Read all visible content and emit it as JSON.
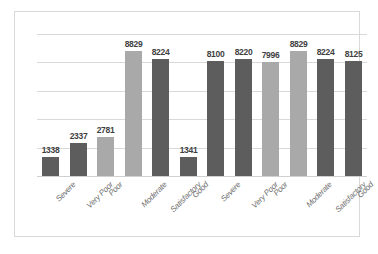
{
  "chart_data": {
    "type": "bar",
    "title": "",
    "subtitle": "",
    "xlabel": "",
    "ylabel": "",
    "ylim": [
      0,
      10000
    ],
    "grid": true,
    "legend": false,
    "legend_position": "none",
    "y_tick_labels": [],
    "categories": [
      "Severe",
      "Very Poor",
      "Poor",
      "Moderate",
      "Satisfactory",
      "Good",
      "Severe",
      "Very Poor",
      "Poor",
      "Moderate",
      "Satisfactory",
      "Good"
    ],
    "values": [
      1338,
      2337,
      2781,
      8829,
      8224,
      1341,
      8100,
      8220,
      7996,
      8829,
      8224,
      8125
    ],
    "data_labels": [
      "1338",
      "2337",
      "2781",
      "8829",
      "8224",
      "1341",
      "8100",
      "8220",
      "7996",
      "8829",
      "8224",
      "8125"
    ],
    "bar_colors": [
      "#5d5d5d",
      "#5d5d5d",
      "#a9a9a9",
      "#a9a9a9",
      "#5d5d5d",
      "#5d5d5d",
      "#5d5d5d",
      "#5d5d5d",
      "#a9a9a9",
      "#a9a9a9",
      "#5d5d5d",
      "#5d5d5d"
    ],
    "gridline_count": 5
  },
  "style": {
    "dark_bar_color": "#5d5d5d",
    "light_bar_color": "#a9a9a9",
    "gridline_color": "#d9d9d9",
    "frame_color": "#d9d9d9",
    "label_color": "#6f6f6f",
    "value_color": "#3f3f3f",
    "background": "#ffffff"
  }
}
